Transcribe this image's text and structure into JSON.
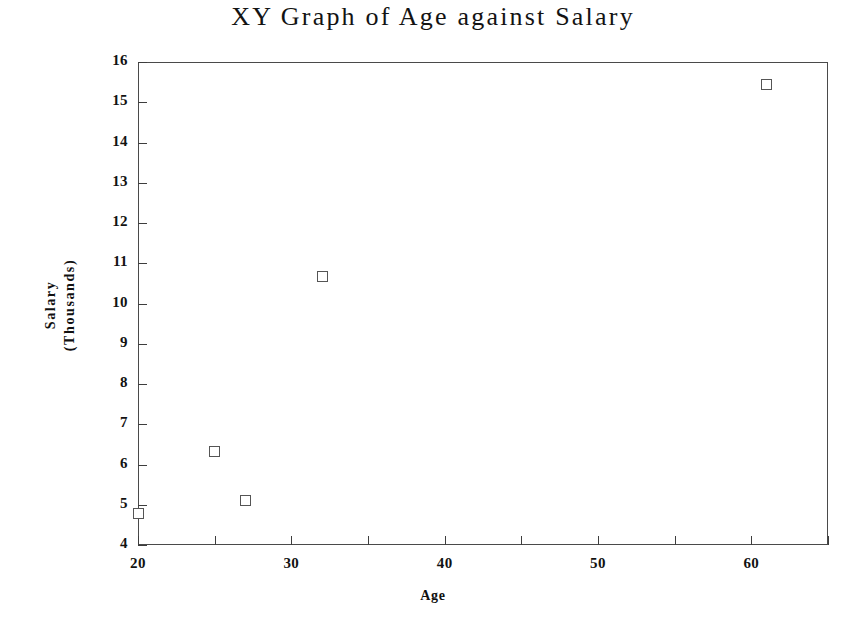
{
  "chart_data": {
    "type": "scatter",
    "title": "XY Graph of Age against Salary",
    "xlabel": "Age",
    "ylabel_lines": [
      "Salary",
      "(Thousands)"
    ],
    "ylabel": "Salary (Thousands)",
    "xlim": [
      20,
      65
    ],
    "ylim": [
      4,
      16
    ],
    "grid": false,
    "legend": false,
    "x_major_ticks": [
      20,
      30,
      40,
      50,
      60
    ],
    "x_minor_ticks": [
      25,
      35,
      45,
      55,
      65
    ],
    "x_tick_labels": [
      "20",
      "30",
      "40",
      "50",
      "60"
    ],
    "y_ticks": [
      4,
      5,
      6,
      7,
      8,
      9,
      10,
      11,
      12,
      13,
      14,
      15,
      16
    ],
    "y_tick_labels": [
      "4",
      "5",
      "6",
      "7",
      "8",
      "9",
      "10",
      "11",
      "12",
      "13",
      "14",
      "15",
      "16"
    ],
    "series": [
      {
        "name": "Age vs Salary",
        "marker": "open-square",
        "marker_color": "#555555",
        "points": [
          {
            "x": 20,
            "y": 4.78
          },
          {
            "x": 25,
            "y": 6.32
          },
          {
            "x": 27,
            "y": 5.1
          },
          {
            "x": 32,
            "y": 10.66
          },
          {
            "x": 61,
            "y": 15.45
          }
        ]
      }
    ]
  },
  "colors": {
    "background": "#ffffff",
    "axis": "#4a4a4a",
    "text": "#121212",
    "marker_stroke": "#555555"
  }
}
